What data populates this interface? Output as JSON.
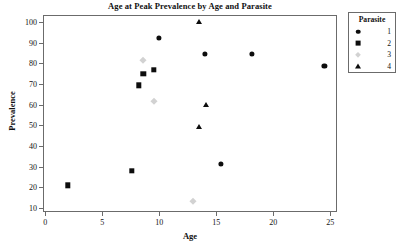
{
  "chart_data": {
    "type": "scatter",
    "title": "Age at Peak Prevalence by Age and Parasite",
    "xlabel": "Age",
    "ylabel": "Prevalence",
    "xlim": [
      -0.2,
      25.6
    ],
    "ylim": [
      8.0,
      103.5
    ],
    "xticks": [
      0,
      5,
      10,
      15,
      20,
      25
    ],
    "yticks": [
      10,
      20,
      30,
      40,
      50,
      60,
      70,
      80,
      90,
      100
    ],
    "xticklabels": [
      "0",
      "5",
      "10",
      "15",
      "20",
      "25"
    ],
    "yticklabels": [
      "10",
      "20",
      "30",
      "40",
      "50",
      "60",
      "70",
      "80",
      "90",
      "100"
    ],
    "grid": false,
    "legend_position": "right-outside",
    "legend_title": "Parasite",
    "series": [
      {
        "name": "1",
        "marker": "circle",
        "color": "#0d0d0d",
        "points": [
          {
            "x": 10.0,
            "y": 92.5
          },
          {
            "x": 14.0,
            "y": 84.5
          },
          {
            "x": 15.4,
            "y": 31.5
          },
          {
            "x": 18.1,
            "y": 84.5
          },
          {
            "x": 24.5,
            "y": 79.0
          }
        ]
      },
      {
        "name": "2",
        "marker": "square",
        "color": "#0d0d0d",
        "points": [
          {
            "x": 2.0,
            "y": 21.0
          },
          {
            "x": 7.6,
            "y": 28.0
          },
          {
            "x": 8.2,
            "y": 69.5
          },
          {
            "x": 8.6,
            "y": 75.0
          },
          {
            "x": 9.5,
            "y": 77.0
          }
        ]
      },
      {
        "name": "3",
        "marker": "diamond",
        "color": "#d2d2d2",
        "points": [
          {
            "x": 8.6,
            "y": 81.5
          },
          {
            "x": 9.5,
            "y": 62.0
          },
          {
            "x": 13.0,
            "y": 13.5
          }
        ]
      },
      {
        "name": "4",
        "marker": "triangle",
        "color": "#0d0d0d",
        "points": [
          {
            "x": 13.5,
            "y": 100.0
          },
          {
            "x": 13.5,
            "y": 49.5
          },
          {
            "x": 14.1,
            "y": 60.0
          }
        ]
      }
    ]
  }
}
